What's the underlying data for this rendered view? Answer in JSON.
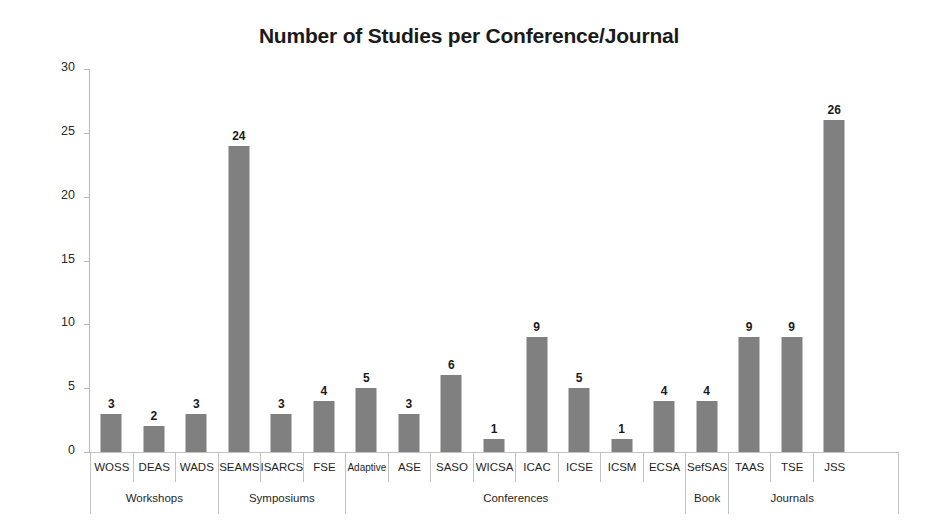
{
  "chart_data": {
    "type": "bar",
    "title": "Number of Studies per Conference/Journal",
    "xlabel": "",
    "ylabel": "Number of studies",
    "ylim": [
      0,
      30
    ],
    "yticks": [
      0,
      5,
      10,
      15,
      20,
      25,
      30
    ],
    "grid": false,
    "legend": null,
    "bar_color": "#808080",
    "categories": [
      "WOSS",
      "DEAS",
      "WADS",
      "SEAMS",
      "ISARCS",
      "FSE",
      "Adaptive",
      "ASE",
      "SASO",
      "WICSA",
      "ICAC",
      "ICSE",
      "ICSM",
      "ECSA",
      "SefSAS",
      "TAAS",
      "TSE",
      "JSS"
    ],
    "values": [
      3,
      2,
      3,
      24,
      3,
      4,
      5,
      3,
      6,
      1,
      9,
      5,
      1,
      4,
      4,
      9,
      9,
      26
    ],
    "groups": [
      {
        "label": "Workshops",
        "span": 3
      },
      {
        "label": "Symposiums",
        "span": 3
      },
      {
        "label": "Conferences",
        "span": 8
      },
      {
        "label": "Book",
        "span": 1
      },
      {
        "label": "Journals",
        "span": 3
      }
    ]
  }
}
